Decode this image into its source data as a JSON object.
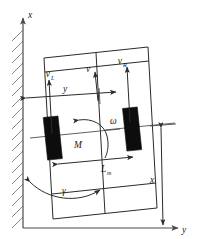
{
  "figure": {
    "background_color": "#ffffff",
    "line_color": "#2b2b2b",
    "wheel_color": "#0d0d0d",
    "wall_hatch_color": "#6a6a6a"
  },
  "axes": {
    "vertical": {
      "label": "x",
      "name": "x-axis-label",
      "direction": "up"
    },
    "horizontal": {
      "label": "y",
      "name": "y-axis-label",
      "direction": "right"
    }
  },
  "wall": {
    "name": "hatched-wall",
    "label": "",
    "hatch_count": 17
  },
  "robot": {
    "name": "robot-chassis",
    "center_line_label": "",
    "wheels": [
      {
        "name": "left-wheel",
        "side": "left"
      },
      {
        "name": "right-wheel",
        "side": "right"
      }
    ]
  },
  "vectors": [
    {
      "id": "v-left",
      "label": "v",
      "subscript": "L",
      "name": "left-wheel-velocity-vector"
    },
    {
      "id": "v-center",
      "label": "v",
      "subscript": "",
      "name": "center-velocity-vector"
    },
    {
      "id": "v-right",
      "label": "v",
      "subscript": "R",
      "name": "right-wheel-velocity-vector"
    }
  ],
  "annotations": {
    "angular_velocity": {
      "label": "ω",
      "name": "angular-velocity-omega-label"
    },
    "moment": {
      "label": "M",
      "name": "moment-m-label"
    },
    "wheel_base": {
      "label": "L",
      "subscript": "m",
      "name": "wheelbase-length-label"
    },
    "heading_angle": {
      "label": "γ",
      "name": "heading-angle-gamma-label"
    },
    "lateral_distance": {
      "label": "y",
      "name": "lateral-distance-y-label"
    },
    "longitudinal_distance": {
      "label": "x",
      "name": "longitudinal-distance-x-label"
    }
  }
}
